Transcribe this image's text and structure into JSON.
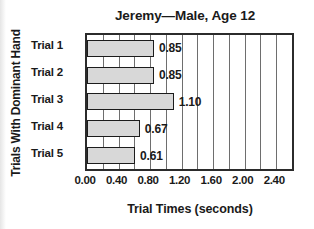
{
  "chart_data": {
    "type": "bar",
    "orientation": "horizontal",
    "title": "Jeremy—Male, Age 12",
    "xlabel": "Trial Times (seconds)",
    "ylabel": "Trials With Dominant Hand",
    "categories": [
      "Trial 1",
      "Trial 2",
      "Trial 3",
      "Trial 4",
      "Trial 5"
    ],
    "values": [
      0.85,
      0.85,
      1.1,
      0.67,
      0.61
    ],
    "value_labels": [
      "0.85",
      "0.85",
      "1.10",
      "0.67",
      "0.61"
    ],
    "xlim": [
      0.0,
      2.6
    ],
    "xticks": [
      0.0,
      0.4,
      0.8,
      1.2,
      1.6,
      2.0,
      2.4
    ],
    "xtick_labels": [
      "0.00",
      "0.40",
      "0.80",
      "1.20",
      "1.60",
      "2.00",
      "2.40"
    ],
    "minor_gridlines": [
      0.2,
      0.4,
      0.6,
      0.8,
      1.0,
      1.2,
      1.4,
      1.6,
      1.8,
      2.0,
      2.2,
      2.4
    ],
    "grid": true,
    "legend": false,
    "bar_fill_color": "#d8d8d8",
    "bar_edge_color": "#1c1c1c",
    "grid_color": "#6e6e6e",
    "axis_color": "#2b2b2b",
    "text_color": "#1a1a1a",
    "background_color": "#ffffff"
  }
}
